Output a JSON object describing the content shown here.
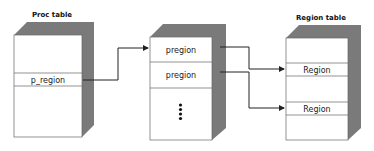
{
  "diagram": {
    "proc_table": {
      "title": "Proc table",
      "entry": "p_region"
    },
    "pregion_table": {
      "entries": [
        "pregion",
        "pregion"
      ],
      "continuation": "vertical-ellipsis"
    },
    "region_table": {
      "title": "Region table",
      "entries": [
        "Region",
        "Region"
      ]
    },
    "arrows": [
      {
        "from": "p_region",
        "to": "pregion table"
      },
      {
        "from": "pregion 1",
        "to": "Region 1"
      },
      {
        "from": "pregion 2",
        "to": "Region 2"
      }
    ],
    "colors": {
      "shadow": "#7a7a7a",
      "face": "#ffffff",
      "line": "#333333"
    }
  }
}
